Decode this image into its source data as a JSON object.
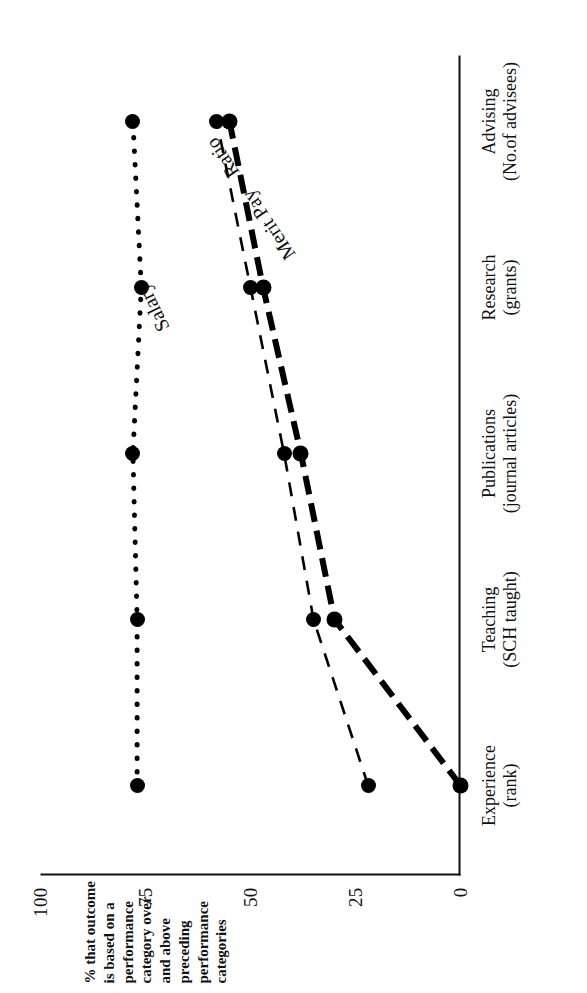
{
  "chart_data": {
    "type": "line",
    "title": "",
    "orientation_note": "figure printed rotated 90 degrees counter-clockwise",
    "xlabel": "",
    "ylabel": "% that outcome is based on a performance category over and above preceding performance categories",
    "ylim": [
      0,
      100
    ],
    "yticks": [
      0,
      25,
      50,
      75,
      100
    ],
    "ytick_labels": [
      "0",
      "25",
      "50",
      "75",
      "100"
    ],
    "grid": false,
    "legend": "inline series labels on lines",
    "categories": [
      "Experience\n(rank)",
      "Teaching\n(SCH taught)",
      "Publications\n(journal articles)",
      "Research\n(grants)",
      "Advising\n(No.of advisees)"
    ],
    "category_lines": [
      {
        "l1": "Experience",
        "l2": "(rank)"
      },
      {
        "l1": "Teaching",
        "l2": "(SCH taught)"
      },
      {
        "l1": "Publications",
        "l2": "(journal articles)"
      },
      {
        "l1": "Research",
        "l2": "(grants)"
      },
      {
        "l1": "Advising",
        "l2": "(No.of advisees)"
      }
    ],
    "series": [
      {
        "name": "Salary",
        "style": "dotted",
        "values": [
          77,
          77,
          78,
          76,
          78
        ]
      },
      {
        "name": "Merit Pay",
        "style": "dashed",
        "values": [
          22,
          35,
          42,
          50,
          58
        ]
      },
      {
        "name": "Ratio",
        "style": "thick-dashed",
        "values": [
          0,
          30,
          38,
          47,
          55
        ]
      }
    ]
  },
  "axis": {
    "y_caption_lines": [
      "% that outcome",
      "is based on a",
      "performance",
      "category over",
      "and above",
      "preceding",
      "performance",
      "categories"
    ]
  },
  "labels": {
    "salary": "Salary",
    "merit_pay": "Merit Pay",
    "ratio": "Ratio"
  }
}
